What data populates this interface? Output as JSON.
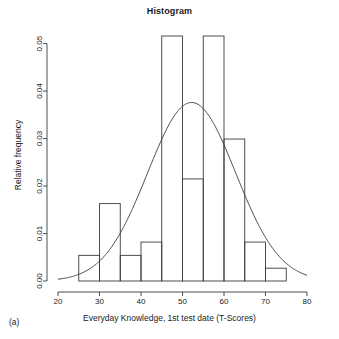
{
  "chart_data": {
    "type": "bar",
    "title": "Histogram",
    "xlabel": "Everyday Knowledge, 1st test date (T-Scores)",
    "ylabel": "Relative frequency",
    "panel_tag": "(a)",
    "xlim": [
      20,
      80
    ],
    "ylim": [
      0.0,
      0.0516
    ],
    "xticks": [
      20,
      30,
      40,
      50,
      60,
      70,
      80
    ],
    "xtick_labels": [
      "20",
      "30",
      "40",
      "50",
      "60",
      "70",
      "80"
    ],
    "yticks": [
      0.0,
      0.01,
      0.02,
      0.03,
      0.04,
      0.05
    ],
    "ytick_labels": [
      "0.00",
      "0.01",
      "0.02",
      "0.03",
      "0.04",
      "0.05"
    ],
    "grid": false,
    "legend": "none",
    "bin_width": 5,
    "bin_edges": [
      25,
      30,
      35,
      40,
      45,
      50,
      55,
      60,
      65,
      70,
      75
    ],
    "categories": [
      "25-30",
      "30-35",
      "35-40",
      "40-45",
      "45-50",
      "50-55",
      "55-60",
      "60-65",
      "65-70",
      "70-75"
    ],
    "values": [
      0.0054,
      0.0163,
      0.0054,
      0.0082,
      0.0516,
      0.0215,
      0.0516,
      0.0299,
      0.0082,
      0.0027
    ],
    "series": [
      {
        "name": "Relative frequency",
        "values": [
          0.0054,
          0.0163,
          0.0054,
          0.0082,
          0.0516,
          0.0215,
          0.0516,
          0.0299,
          0.0082,
          0.0027
        ]
      }
    ],
    "overlay": {
      "name": "normal density curve",
      "type": "line",
      "mean": 52.2,
      "sd": 10.6,
      "peak_value": 0.0376,
      "x_start": 20,
      "x_end": 80
    }
  }
}
